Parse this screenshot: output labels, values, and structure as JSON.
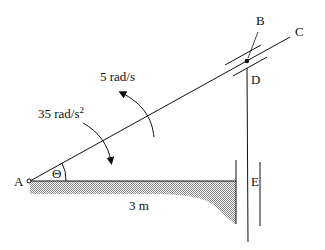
{
  "diagram": {
    "type": "mechanism",
    "labels": {
      "A": "A",
      "B": "B",
      "C": "C",
      "D": "D",
      "E": "E",
      "theta": "Θ",
      "distance": "3 m",
      "angular_velocity": "5 rad/s",
      "angular_accel_value": "35 rad/s",
      "angular_accel_exp": "2"
    },
    "colors": {
      "line": "#111111",
      "hatch": "#9a9a9a"
    }
  }
}
